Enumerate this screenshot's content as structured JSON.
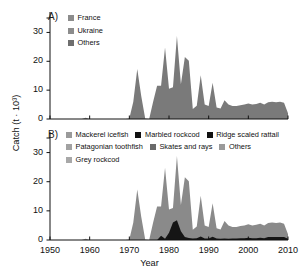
{
  "figure": {
    "axis_title_y": "Catch (t · 10³)",
    "axis_title_x": "Year"
  },
  "panel_a": {
    "letter": "A)",
    "legend": [
      {
        "label": "France",
        "color": "#8c8c8c"
      },
      {
        "label": "Ukraine",
        "color": "#8c8c8c"
      },
      {
        "label": "Others",
        "color": "#6e6e6e"
      }
    ],
    "y_ticks": [
      "0",
      "10",
      "20",
      "30"
    ],
    "x_ticks": [
      "1950",
      "1960",
      "1970",
      "1980",
      "1990",
      "2000",
      "2010"
    ]
  },
  "panel_b": {
    "letter": "B)",
    "legend": [
      [
        {
          "label": "Mackerel icefish",
          "color": "#9a9a9a"
        },
        {
          "label": "Marbled rockcod",
          "color": "#111111"
        },
        {
          "label": "Ridge scaled rattail",
          "color": "#111111"
        }
      ],
      [
        {
          "label": "Patagonian toothfish",
          "color": "#a2a2a2"
        },
        {
          "label": "Skates and rays",
          "color": "#6a6a6a"
        },
        {
          "label": "Others",
          "color": "#9a9a9a"
        }
      ],
      [
        {
          "label": "Grey rockcod",
          "color": "#a8a8a8"
        }
      ]
    ],
    "y_ticks": [
      "0",
      "10",
      "20",
      "30"
    ],
    "x_ticks": [
      "1950",
      "1960",
      "1970",
      "1980",
      "1990",
      "2000",
      "2010"
    ]
  },
  "chart_data": {
    "type": "area",
    "title": "",
    "xlabel": "Year",
    "ylabel": "Catch (t · 10³)",
    "xlim": [
      1950,
      2010
    ],
    "ylim": [
      0,
      35
    ],
    "grid": false,
    "legend_position": "inside-top-left",
    "panels": [
      {
        "panel": "A",
        "label": "A)",
        "stacked": true,
        "x": [
          1950,
          1951,
          1952,
          1953,
          1954,
          1955,
          1956,
          1957,
          1958,
          1959,
          1960,
          1961,
          1962,
          1963,
          1964,
          1965,
          1966,
          1967,
          1968,
          1969,
          1970,
          1971,
          1972,
          1973,
          1974,
          1975,
          1976,
          1977,
          1978,
          1979,
          1980,
          1981,
          1982,
          1983,
          1984,
          1985,
          1986,
          1987,
          1988,
          1989,
          1990,
          1991,
          1992,
          1993,
          1994,
          1995,
          1996,
          1997,
          1998,
          1999,
          2000,
          2001,
          2002,
          2003,
          2004,
          2005,
          2006,
          2007,
          2008,
          2009,
          2010
        ],
        "series": [
          {
            "name": "Others",
            "color": "#7a7a7a",
            "values": [
              0,
              0,
              0,
              0,
              0,
              0,
              0,
              0,
              0,
              0.4,
              0,
              0,
              0,
              0,
              0,
              0,
              0,
              0,
              0,
              0,
              0.2,
              6.0,
              17.3,
              8.0,
              0.2,
              0,
              6.0,
              11.5,
              11.5,
              24.8,
              10.5,
              11.0,
              28.8,
              12.0,
              21.5,
              20.2,
              3.5,
              4.6,
              15.2,
              5.0,
              4.5,
              12.6,
              4.0,
              3.6,
              6.5,
              5.0,
              4.5,
              4.5,
              4.8,
              5.0,
              5.4,
              5.0,
              5.2,
              5.6,
              5.0,
              5.8,
              6.0,
              5.8,
              6.0,
              5.6,
              2.0
            ]
          },
          {
            "name": "Ukraine",
            "color": "#8c8c8c",
            "values": [
              0,
              0,
              0,
              0,
              0,
              0,
              0,
              0,
              0,
              0,
              0,
              0,
              0,
              0,
              0,
              0,
              0,
              0,
              0,
              0,
              0,
              0,
              0,
              0,
              0,
              0,
              0,
              0,
              0,
              0,
              0,
              0,
              0,
              0,
              0,
              0,
              0,
              0,
              0,
              0,
              0,
              0,
              0,
              0,
              0,
              0,
              0,
              0,
              0,
              0,
              0,
              0,
              0,
              0,
              0,
              0,
              0,
              0,
              0,
              0,
              0
            ]
          },
          {
            "name": "France",
            "color": "#8c8c8c",
            "values": [
              0,
              0,
              0,
              0,
              0,
              0,
              0,
              0,
              0,
              0,
              0,
              0,
              0,
              0,
              0,
              0,
              0,
              0,
              0,
              0,
              0,
              0,
              0,
              0,
              0,
              0,
              0,
              0,
              0,
              0,
              0,
              0,
              0,
              0,
              0,
              0,
              0,
              0,
              0,
              0,
              0,
              0,
              0,
              0,
              0,
              0,
              0,
              0,
              0,
              0,
              0,
              0,
              0,
              0,
              0,
              0,
              0,
              0,
              0,
              0,
              0
            ]
          }
        ]
      },
      {
        "panel": "B",
        "label": "B)",
        "stacked": true,
        "x": [
          1950,
          1951,
          1952,
          1953,
          1954,
          1955,
          1956,
          1957,
          1958,
          1959,
          1960,
          1961,
          1962,
          1963,
          1964,
          1965,
          1966,
          1967,
          1968,
          1969,
          1970,
          1971,
          1972,
          1973,
          1974,
          1975,
          1976,
          1977,
          1978,
          1979,
          1980,
          1981,
          1982,
          1983,
          1984,
          1985,
          1986,
          1987,
          1988,
          1989,
          1990,
          1991,
          1992,
          1993,
          1994,
          1995,
          1996,
          1997,
          1998,
          1999,
          2000,
          2001,
          2002,
          2003,
          2004,
          2005,
          2006,
          2007,
          2008,
          2009,
          2010
        ],
        "series": [
          {
            "name": "Mackerel icefish",
            "color": "#8a8a8a",
            "values": [
              0,
              0,
              0,
              0,
              0,
              0,
              0,
              0,
              0,
              0.4,
              0,
              0,
              0,
              0,
              0,
              0,
              0,
              0,
              0,
              0,
              0.2,
              6.0,
              17.3,
              8.0,
              0.2,
              0,
              6.0,
              11.5,
              10.0,
              24.4,
              8.0,
              5.0,
              22.0,
              9.0,
              20.5,
              19.5,
              3.0,
              4.0,
              14.0,
              4.5,
              4.0,
              11.5,
              3.5,
              3.2,
              6.0,
              4.6,
              4.0,
              4.0,
              4.2,
              4.4,
              4.6,
              4.4,
              4.6,
              4.8,
              4.4,
              4.8,
              5.0,
              4.8,
              5.0,
              4.6,
              1.6
            ]
          },
          {
            "name": "Marbled rockcod",
            "color": "#151515",
            "values": [
              0,
              0,
              0,
              0,
              0,
              0,
              0,
              0,
              0,
              0,
              0,
              0,
              0,
              0,
              0,
              0,
              0,
              0,
              0,
              0,
              0,
              0,
              0,
              0,
              0,
              0,
              0,
              0,
              1.5,
              0.4,
              2.5,
              6.0,
              6.8,
              3.0,
              1.0,
              0.7,
              0.5,
              0.6,
              1.2,
              0.5,
              0.5,
              1.1,
              0.5,
              0.4,
              0.5,
              0.4,
              0.5,
              0.5,
              0.6,
              0.6,
              0.8,
              0.6,
              0.6,
              0.8,
              0.6,
              1.0,
              1.0,
              1.0,
              1.0,
              1.0,
              0.4
            ]
          },
          {
            "name": "Ridge scaled rattail",
            "color": "#151515",
            "values": [
              0,
              0,
              0,
              0,
              0,
              0,
              0,
              0,
              0,
              0,
              0,
              0,
              0,
              0,
              0,
              0,
              0,
              0,
              0,
              0,
              0,
              0,
              0,
              0,
              0,
              0,
              0,
              0,
              0,
              0,
              0,
              0,
              0,
              0,
              0,
              0,
              0,
              0,
              0,
              0,
              0,
              0,
              0,
              0,
              0,
              0,
              0,
              0,
              0,
              0,
              0,
              0,
              0,
              0,
              0,
              0,
              0,
              0,
              0,
              0,
              0
            ]
          },
          {
            "name": "Patagonian toothfish",
            "color": "#a2a2a2",
            "values": [
              0,
              0,
              0,
              0,
              0,
              0,
              0,
              0,
              0,
              0,
              0,
              0,
              0,
              0,
              0,
              0,
              0,
              0,
              0,
              0,
              0,
              0,
              0,
              0,
              0,
              0,
              0,
              0,
              0,
              0,
              0,
              0,
              0,
              0,
              0,
              0,
              0,
              0,
              0,
              0,
              0,
              0,
              0,
              0,
              0,
              0,
              0,
              0,
              0,
              0,
              0,
              0,
              0,
              0,
              0,
              0,
              0,
              0,
              0,
              0,
              0
            ]
          },
          {
            "name": "Skates and rays",
            "color": "#6a6a6a",
            "values": [
              0,
              0,
              0,
              0,
              0,
              0,
              0,
              0,
              0,
              0,
              0,
              0,
              0,
              0,
              0,
              0,
              0,
              0,
              0,
              0,
              0,
              0,
              0,
              0,
              0,
              0,
              0,
              0,
              0,
              0,
              0,
              0,
              0,
              0,
              0,
              0,
              0,
              0,
              0,
              0,
              0,
              0,
              0,
              0,
              0,
              0,
              0,
              0,
              0,
              0,
              0,
              0,
              0,
              0,
              0,
              0,
              0,
              0,
              0,
              0,
              0
            ]
          },
          {
            "name": "Others",
            "color": "#9a9a9a",
            "values": [
              0,
              0,
              0,
              0,
              0,
              0,
              0,
              0,
              0,
              0,
              0,
              0,
              0,
              0,
              0,
              0,
              0,
              0,
              0,
              0,
              0,
              0,
              0,
              0,
              0,
              0,
              0,
              0,
              0,
              0,
              0,
              0,
              0,
              0,
              0,
              0,
              0,
              0,
              0,
              0,
              0,
              0,
              0,
              0,
              0,
              0,
              0,
              0,
              0,
              0,
              0,
              0,
              0,
              0,
              0,
              0,
              0,
              0,
              0,
              0,
              0
            ]
          },
          {
            "name": "Grey rockcod",
            "color": "#a8a8a8",
            "values": [
              0,
              0,
              0,
              0,
              0,
              0,
              0,
              0,
              0,
              0,
              0,
              0,
              0,
              0,
              0,
              0,
              0,
              0,
              0,
              0,
              0,
              0,
              0,
              0,
              0,
              0,
              0,
              0,
              0,
              0,
              0,
              0,
              0,
              0,
              0,
              0,
              0,
              0,
              0,
              0,
              0,
              0,
              0,
              0,
              0,
              0,
              0,
              0,
              0,
              0,
              0,
              0,
              0,
              0,
              0,
              0,
              0,
              0,
              0,
              0,
              0
            ]
          }
        ]
      }
    ]
  }
}
